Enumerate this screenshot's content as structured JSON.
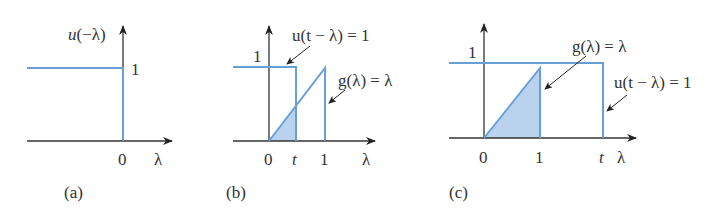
{
  "colors": {
    "signal": "#6a9fd6",
    "fill": "#b9d3ef",
    "axis": "#333333"
  },
  "panels": [
    {
      "id": "a",
      "caption": "(a)",
      "function_label": "u(−λ)",
      "y_tick": "1",
      "x_ticks": [
        "0"
      ],
      "x_axis_label": "λ"
    },
    {
      "id": "b",
      "caption": "(b)",
      "y_tick": "1",
      "step_label": "u(t − λ) = 1",
      "ramp_label": "g(λ) = λ",
      "x_ticks": [
        "0",
        "t",
        "1"
      ],
      "x_axis_label": "λ"
    },
    {
      "id": "c",
      "caption": "(c)",
      "y_tick": "1",
      "step_label": "u(t − λ) = 1",
      "ramp_label": "g(λ) = λ",
      "x_ticks": [
        "0",
        "1",
        "t"
      ],
      "x_axis_label": "λ"
    }
  ]
}
